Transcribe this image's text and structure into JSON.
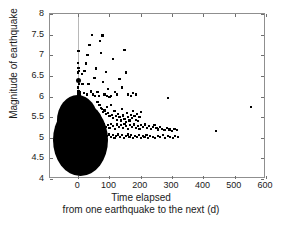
{
  "chart_data": {
    "type": "scatter",
    "title": "",
    "xlabel": "Time elapsed from one earthquake to the next (d)",
    "xlabel_line1": "Time elapsed",
    "xlabel_line2": "from one earthquake to the next (d)",
    "ylabel": "Magnitude of earthquake",
    "xlim": [
      -90,
      600
    ],
    "ylim": [
      4,
      8
    ],
    "xticks": [
      0,
      100,
      200,
      300,
      400,
      500,
      600
    ],
    "xtick_labels": [
      "0",
      "100",
      "200",
      "300",
      "400",
      "500",
      "600"
    ],
    "yticks": [
      4,
      4.5,
      5,
      5.5,
      6,
      6.5,
      7,
      7.5,
      8
    ],
    "ytick_labels": [
      "4",
      "4.5",
      "5",
      "5.5",
      "6",
      "6.5",
      "7",
      "7.5",
      "8"
    ],
    "grid": false,
    "legend": null,
    "marker_color": "#000000",
    "marker_shape": "square",
    "reference_line_x": 0,
    "reference_line_color": "#b8b8b8",
    "frame_color": "#8f8f8f",
    "annotation": "Overplotted saturated cluster of points near zero elapsed time spanning magnitude 4.3-6.0",
    "points": [
      [
        2,
        6.4
      ],
      [
        1,
        7.1
      ],
      [
        0,
        6.82
      ],
      [
        1,
        6.7
      ],
      [
        0,
        6.58
      ],
      [
        2,
        6.3
      ],
      [
        0,
        6.22
      ],
      [
        1,
        6.12
      ],
      [
        0,
        6.05
      ],
      [
        2,
        6.0
      ],
      [
        1,
        5.95
      ],
      [
        0,
        5.88
      ],
      [
        3,
        6.62
      ],
      [
        4,
        6.1
      ],
      [
        6,
        6.05
      ],
      [
        8,
        5.92
      ],
      [
        12,
        6.55
      ],
      [
        14,
        6.3
      ],
      [
        18,
        6.08
      ],
      [
        20,
        6.62
      ],
      [
        24,
        6.8
      ],
      [
        27,
        6.05
      ],
      [
        30,
        7.0
      ],
      [
        33,
        6.3
      ],
      [
        36,
        7.25
      ],
      [
        40,
        6.12
      ],
      [
        44,
        7.5
      ],
      [
        47,
        6.05
      ],
      [
        52,
        6.45
      ],
      [
        55,
        6.02
      ],
      [
        58,
        6.68
      ],
      [
        62,
        6.1
      ],
      [
        66,
        6.02
      ],
      [
        70,
        7.35
      ],
      [
        74,
        7.05
      ],
      [
        78,
        7.48
      ],
      [
        80,
        6.35
      ],
      [
        84,
        6.05
      ],
      [
        88,
        6.6
      ],
      [
        92,
        6.02
      ],
      [
        96,
        6.18
      ],
      [
        100,
        5.98
      ],
      [
        104,
        6.02
      ],
      [
        112,
        6.9
      ],
      [
        118,
        6.1
      ],
      [
        124,
        6.05
      ],
      [
        132,
        6.42
      ],
      [
        140,
        6.22
      ],
      [
        148,
        7.12
      ],
      [
        152,
        6.58
      ],
      [
        160,
        6.05
      ],
      [
        168,
        6.02
      ],
      [
        176,
        6.08
      ],
      [
        186,
        6.05
      ],
      [
        62,
        5.86
      ],
      [
        68,
        5.8
      ],
      [
        72,
        5.72
      ],
      [
        76,
        5.7
      ],
      [
        80,
        5.62
      ],
      [
        84,
        5.66
      ],
      [
        88,
        5.58
      ],
      [
        92,
        5.74
      ],
      [
        96,
        5.6
      ],
      [
        100,
        5.52
      ],
      [
        104,
        5.8
      ],
      [
        108,
        5.56
      ],
      [
        112,
        5.48
      ],
      [
        116,
        5.64
      ],
      [
        120,
        5.52
      ],
      [
        124,
        5.44
      ],
      [
        128,
        5.58
      ],
      [
        132,
        5.5
      ],
      [
        136,
        5.42
      ],
      [
        140,
        5.7
      ],
      [
        144,
        5.54
      ],
      [
        148,
        5.46
      ],
      [
        152,
        5.38
      ],
      [
        156,
        5.6
      ],
      [
        160,
        5.5
      ],
      [
        164,
        5.42
      ],
      [
        168,
        5.56
      ],
      [
        172,
        5.48
      ],
      [
        176,
        5.64
      ],
      [
        180,
        5.52
      ],
      [
        184,
        5.44
      ],
      [
        188,
        5.58
      ],
      [
        192,
        5.4
      ],
      [
        196,
        5.5
      ],
      [
        200,
        5.62
      ],
      [
        58,
        5.36
      ],
      [
        64,
        5.3
      ],
      [
        70,
        5.34
      ],
      [
        76,
        5.28
      ],
      [
        82,
        5.32
      ],
      [
        88,
        5.26
      ],
      [
        94,
        5.3
      ],
      [
        100,
        5.24
      ],
      [
        106,
        5.34
      ],
      [
        112,
        5.28
      ],
      [
        118,
        5.22
      ],
      [
        124,
        5.32
      ],
      [
        130,
        5.26
      ],
      [
        136,
        5.3
      ],
      [
        142,
        5.24
      ],
      [
        148,
        5.34
      ],
      [
        154,
        5.28
      ],
      [
        160,
        5.22
      ],
      [
        166,
        5.3
      ],
      [
        172,
        5.26
      ],
      [
        178,
        5.32
      ],
      [
        184,
        5.24
      ],
      [
        190,
        5.28
      ],
      [
        196,
        5.22
      ],
      [
        202,
        5.3
      ],
      [
        208,
        5.26
      ],
      [
        214,
        5.32
      ],
      [
        220,
        5.24
      ],
      [
        226,
        5.28
      ],
      [
        232,
        5.22
      ],
      [
        238,
        5.26
      ],
      [
        244,
        5.3
      ],
      [
        250,
        5.24
      ],
      [
        256,
        5.2
      ],
      [
        262,
        5.26
      ],
      [
        268,
        5.22
      ],
      [
        276,
        5.18
      ],
      [
        284,
        5.24
      ],
      [
        292,
        5.2
      ],
      [
        300,
        5.16
      ],
      [
        308,
        5.22
      ],
      [
        316,
        5.18
      ],
      [
        56,
        5.1
      ],
      [
        62,
        5.04
      ],
      [
        68,
        5.08
      ],
      [
        74,
        5.02
      ],
      [
        80,
        5.06
      ],
      [
        86,
        5.0
      ],
      [
        92,
        5.04
      ],
      [
        98,
        5.08
      ],
      [
        104,
        5.02
      ],
      [
        110,
        5.06
      ],
      [
        116,
        5.0
      ],
      [
        122,
        5.04
      ],
      [
        128,
        5.08
      ],
      [
        134,
        5.02
      ],
      [
        140,
        5.06
      ],
      [
        146,
        5.0
      ],
      [
        152,
        5.04
      ],
      [
        158,
        5.08
      ],
      [
        164,
        5.02
      ],
      [
        170,
        5.06
      ],
      [
        176,
        5.0
      ],
      [
        182,
        5.04
      ],
      [
        188,
        5.02
      ],
      [
        194,
        5.06
      ],
      [
        200,
        5.0
      ],
      [
        206,
        5.04
      ],
      [
        212,
        5.02
      ],
      [
        218,
        5.06
      ],
      [
        224,
        5.0
      ],
      [
        230,
        5.04
      ],
      [
        238,
        5.02
      ],
      [
        246,
        5.0
      ],
      [
        254,
        5.04
      ],
      [
        262,
        5.02
      ],
      [
        270,
        5.06
      ],
      [
        278,
        5.0
      ],
      [
        286,
        5.04
      ],
      [
        294,
        5.02
      ],
      [
        302,
        5.0
      ],
      [
        310,
        5.04
      ],
      [
        318,
        5.02
      ],
      [
        288,
        5.97
      ],
      [
        440,
        5.17
      ],
      [
        551,
        5.75
      ]
    ],
    "large_points": [
      [
        2,
        6.4
      ]
    ],
    "cluster_blobs": [
      {
        "cx": 8,
        "cy": 4.95,
        "rx": 88,
        "ry": 0.88,
        "note": "main-dense-cluster"
      },
      {
        "cx": -2,
        "cy": 5.42,
        "rx": 66,
        "ry": 0.62,
        "note": "upper-dense-cluster"
      },
      {
        "cx": 18,
        "cy": 5.3,
        "rx": 62,
        "ry": 0.52,
        "note": "right-spur"
      }
    ]
  }
}
